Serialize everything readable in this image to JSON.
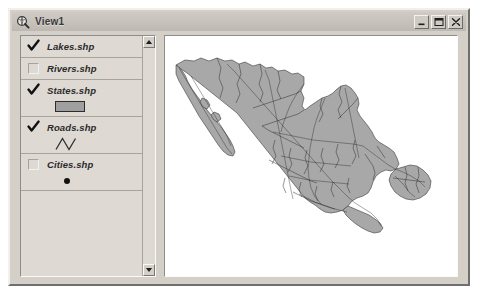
{
  "window": {
    "title": "View1",
    "title_icon": "magnifier-globe-icon",
    "controls": {
      "minimize": "minimize-icon",
      "maximize": "maximize-icon",
      "close": "close-icon"
    }
  },
  "toc": {
    "scrollbar": {
      "up_arrow": "scroll-up-arrow-icon",
      "down_arrow": "scroll-down-arrow-icon"
    },
    "layers": [
      {
        "name": "Lakes.shp",
        "checked": true,
        "symbol": "none"
      },
      {
        "name": "Rivers.shp",
        "checked": false,
        "symbol": "none"
      },
      {
        "name": "States.shp",
        "checked": true,
        "symbol": "polygon-swatch",
        "symbol_fill": "#9f9f9f",
        "symbol_outline": "#2d2d2d"
      },
      {
        "name": "Roads.shp",
        "checked": true,
        "symbol": "zigzag-line",
        "symbol_color": "#333333"
      },
      {
        "name": "Cities.shp",
        "checked": false,
        "symbol": "point-dot",
        "symbol_color": "#111111"
      }
    ]
  },
  "map": {
    "name": "mexico-map",
    "background": "#ffffff",
    "land_fill": "#a8a8a8",
    "boundary_color": "#2e2e2e"
  },
  "colors": {
    "window_face": "#d4d0c8",
    "titlebar": "#c6c2bb",
    "toc_face": "#dedad3"
  }
}
